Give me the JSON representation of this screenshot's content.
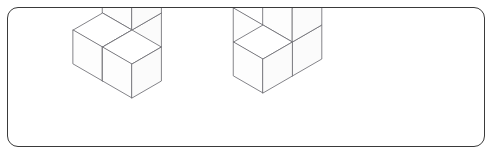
{
  "page": {
    "width": 494,
    "height": 156,
    "background_color": "#ffffff"
  },
  "frame": {
    "label": "rounded-rectangle-border",
    "stroke_color": "#3a3a3a",
    "corner_radius": 11,
    "stroke_width": 1.3
  },
  "render": {
    "line_color": "#6e6e74",
    "face_color": "#ffffff",
    "line_width": 0.85,
    "projection": "isometric",
    "cube_edge_px": 34,
    "iso_dx": 29.4,
    "iso_dy": 17.0
  },
  "figures": [
    {
      "id": "figure-left",
      "label": "Left cube figure",
      "cube_count": 4,
      "origin": {
        "x": 131,
        "y": 97
      },
      "description": "L-shaped staircase of four cubes: two cubes in a back row, one front-left cube, one cube stacked on the back-right cube.",
      "cubes": [
        {
          "name": "front-left-lower",
          "gx": 0,
          "gy": 0,
          "gz": 0
        },
        {
          "name": "back-left-lower",
          "gx": 0,
          "gy": 1,
          "gz": 0
        },
        {
          "name": "back-right-lower",
          "gx": 1,
          "gy": 1,
          "gz": 0
        },
        {
          "name": "back-right-upper",
          "gx": 1,
          "gy": 1,
          "gz": 1
        }
      ]
    },
    {
      "id": "figure-right",
      "label": "Right cube figure",
      "cube_count": 4,
      "origin": {
        "x": 262,
        "y": 92
      },
      "description": "T-shaped arrangement of four cubes: a left pair in a row, one cube to the right, and one cube raised at the centre back.",
      "cubes": [
        {
          "name": "left-outer-lower",
          "gx": 0,
          "gy": 0,
          "gz": 0
        },
        {
          "name": "left-inner-lower",
          "gx": 1,
          "gy": 0,
          "gz": 0
        },
        {
          "name": "right-lower",
          "gx": 1,
          "gy": 1,
          "gz": 0
        },
        {
          "name": "centre-upper",
          "gx": 1,
          "gy": 0,
          "gz": 1
        }
      ]
    }
  ]
}
